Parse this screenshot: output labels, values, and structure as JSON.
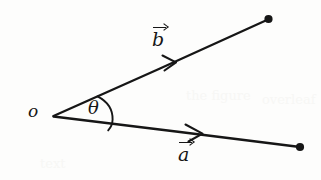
{
  "figure": {
    "type": "vector-angle-diagram",
    "background_color": "#fdfdfc",
    "ink_color": "#161616",
    "width": 321,
    "height": 180,
    "origin": {
      "label": "o",
      "name": "origin-point",
      "x": 53,
      "y": 116
    },
    "angle": {
      "label": "θ",
      "name": "angle-theta",
      "arc_radius": 48,
      "approx_degrees": 31,
      "label_x": 97,
      "label_y": 110
    },
    "vectors": [
      {
        "name": "vector-b",
        "label": "b",
        "accent": "arrow-overbar",
        "start_x": 53,
        "start_y": 116,
        "end_x": 268,
        "end_y": 19,
        "approx_direction_degrees": -24.3,
        "arrowhead_x": 170,
        "arrowhead_y": 62,
        "endpoint_dot": true,
        "label_x": 162,
        "label_y": 38
      },
      {
        "name": "vector-a",
        "label": "a",
        "accent": "arrow-overbar",
        "start_x": 53,
        "start_y": 116,
        "end_x": 300,
        "end_y": 147,
        "approx_direction_degrees": 7.2,
        "arrowhead_x": 196,
        "arrowhead_y": 134,
        "endpoint_dot": true,
        "label_x": 188,
        "label_y": 156
      }
    ],
    "bleed_through": [
      {
        "text": "the figure",
        "x": 186,
        "y": 88
      },
      {
        "text": "overleaf",
        "x": 262,
        "y": 92
      },
      {
        "text": "text",
        "x": 40,
        "y": 156
      }
    ]
  }
}
